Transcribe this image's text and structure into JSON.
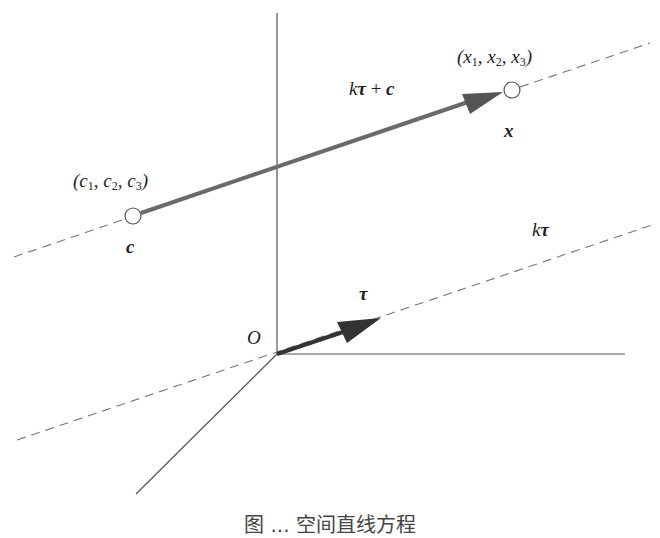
{
  "diagram": {
    "origin_label": "O",
    "point_c": {
      "coords_label_parts": [
        "c",
        "1",
        "c",
        "2",
        "c",
        "3"
      ],
      "coords_text": "(c1, c2, c3)",
      "vector_label": "c",
      "center": [
        133,
        216
      ]
    },
    "point_x": {
      "coords_text": "(x1, x2, x3)",
      "vector_label": "x",
      "center": [
        512,
        90
      ]
    },
    "labels": {
      "k_tau_plus_c": "kτ + c",
      "k": "k",
      "tau": "τ",
      "plus": " + ",
      "c": "c",
      "k_tau": "kτ"
    },
    "caption": "图 ... 空间直线方程"
  },
  "colors": {
    "axis": "#555555",
    "dashed": "#777777",
    "arrow_c_to_x": "#6a6a6a",
    "arrow_tau": "#333333",
    "text": "#222222"
  }
}
